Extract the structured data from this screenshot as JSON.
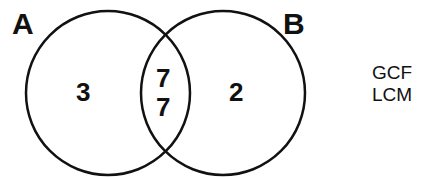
{
  "diagram": {
    "type": "venn",
    "sets": [
      {
        "label": "A",
        "only_values": [
          "3"
        ]
      },
      {
        "label": "B",
        "only_values": [
          "2"
        ]
      }
    ],
    "intersection_values": [
      "7",
      "7"
    ],
    "side_labels": [
      "GCF",
      "LCM"
    ],
    "colors": {
      "stroke": "#111111",
      "background": "#ffffff"
    }
  }
}
